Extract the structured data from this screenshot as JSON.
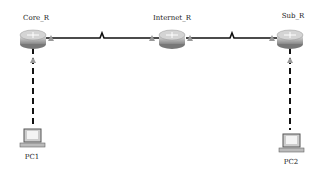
{
  "diagram": {
    "type": "network-topology",
    "nodes": [
      {
        "id": "core",
        "label": "Core_R",
        "kind": "router"
      },
      {
        "id": "internet",
        "label": "Internet_R",
        "kind": "router"
      },
      {
        "id": "sub",
        "label": "Sub_R",
        "kind": "router"
      },
      {
        "id": "pc1",
        "label": "PC1",
        "kind": "pc"
      },
      {
        "id": "pc2",
        "label": "PC2",
        "kind": "pc"
      }
    ],
    "links": [
      {
        "from": "core",
        "to": "internet",
        "style": "serial"
      },
      {
        "from": "internet",
        "to": "sub",
        "style": "serial"
      },
      {
        "from": "core",
        "to": "pc1",
        "style": "dashed-ethernet"
      },
      {
        "from": "sub",
        "to": "pc2",
        "style": "dashed-ethernet"
      }
    ]
  }
}
